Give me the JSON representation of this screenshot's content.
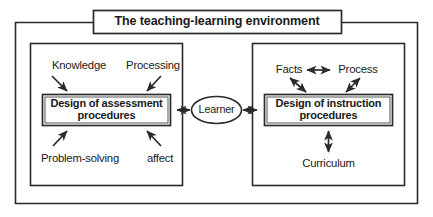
{
  "diagram": {
    "title": "The teaching-learning environment",
    "colors": {
      "stroke": "#2b2b2b",
      "background": "#ffffff",
      "text": "#1a1a1a"
    },
    "outer_frame": {
      "name": "teaching-learning-environment-frame"
    },
    "center": {
      "node": "Learner",
      "left_connector": "double-arrow",
      "right_connector": "double-arrow"
    },
    "left_panel": {
      "name": "assessment-panel",
      "central_box": {
        "line1": "Design of assessment",
        "line2": "procedures"
      },
      "inputs": [
        {
          "label": "Knowledge",
          "position": "top-left",
          "arrow": "single-arrow-down-right"
        },
        {
          "label": "Processing",
          "position": "top-right",
          "arrow": "single-arrow-down-left"
        },
        {
          "label": "Problem-solving",
          "position": "bottom-left",
          "arrow": "single-arrow-up-right"
        },
        {
          "label": "affect",
          "position": "bottom-right",
          "arrow": "single-arrow-up-left"
        }
      ]
    },
    "right_panel": {
      "name": "instruction-panel",
      "central_box": {
        "line1": "Design of instruction",
        "line2": "procedures"
      },
      "inputs": [
        {
          "label": "Facts",
          "position": "top-left",
          "arrow": "double-arrow-diagonal"
        },
        {
          "label": "Process",
          "position": "top-right",
          "arrow": "double-arrow-diagonal"
        },
        {
          "label": "Curriculum",
          "position": "bottom-center",
          "arrow": "double-arrow-vertical"
        }
      ],
      "top_connector": "double-arrow-horizontal"
    }
  }
}
